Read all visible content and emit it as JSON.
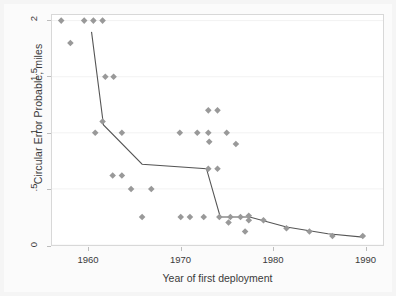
{
  "chart_data": {
    "type": "scatter",
    "title": "",
    "xlabel": "Year of first deployment",
    "ylabel": "Circular Error Probable, miles",
    "xlim": [
      1956,
      1992
    ],
    "ylim": [
      0,
      2.05
    ],
    "xticks": [
      1960,
      1970,
      1980,
      1990
    ],
    "xticklabels": [
      "1960",
      "1970",
      "1980",
      "1990"
    ],
    "yticks": [
      0,
      0.5,
      1,
      1.5,
      2
    ],
    "yticklabels": [
      "0",
      ".5",
      "1",
      "1.5",
      "2"
    ],
    "grid": "horizontal-faint",
    "legend": "none",
    "marker": "diamond",
    "marker_color": "#999999",
    "line_color": "#555555",
    "series": [
      {
        "name": "Missile systems",
        "type": "scatter",
        "points": [
          {
            "x": 1957.0,
            "y": 2.0
          },
          {
            "x": 1958.0,
            "y": 1.8
          },
          {
            "x": 1959.5,
            "y": 2.0
          },
          {
            "x": 1960.5,
            "y": 2.0
          },
          {
            "x": 1961.5,
            "y": 2.0
          },
          {
            "x": 1960.7,
            "y": 1.0
          },
          {
            "x": 1961.8,
            "y": 1.5
          },
          {
            "x": 1962.7,
            "y": 1.5
          },
          {
            "x": 1961.5,
            "y": 1.1
          },
          {
            "x": 1962.6,
            "y": 0.62
          },
          {
            "x": 1963.6,
            "y": 0.62
          },
          {
            "x": 1963.6,
            "y": 1.0
          },
          {
            "x": 1964.6,
            "y": 0.5
          },
          {
            "x": 1966.8,
            "y": 0.5
          },
          {
            "x": 1965.8,
            "y": 0.25
          },
          {
            "x": 1969.9,
            "y": 1.0
          },
          {
            "x": 1971.8,
            "y": 1.0
          },
          {
            "x": 1970.0,
            "y": 0.25
          },
          {
            "x": 1971.0,
            "y": 0.25
          },
          {
            "x": 1973.0,
            "y": 1.2
          },
          {
            "x": 1974.0,
            "y": 1.2
          },
          {
            "x": 1973.0,
            "y": 1.0
          },
          {
            "x": 1973.1,
            "y": 0.92
          },
          {
            "x": 1975.0,
            "y": 1.0
          },
          {
            "x": 1976.0,
            "y": 0.9
          },
          {
            "x": 1973.0,
            "y": 0.68
          },
          {
            "x": 1974.0,
            "y": 0.68
          },
          {
            "x": 1972.5,
            "y": 0.25
          },
          {
            "x": 1974.2,
            "y": 0.25
          },
          {
            "x": 1975.4,
            "y": 0.25
          },
          {
            "x": 1975.2,
            "y": 0.2
          },
          {
            "x": 1976.5,
            "y": 0.25
          },
          {
            "x": 1977.4,
            "y": 0.26
          },
          {
            "x": 1977.4,
            "y": 0.22
          },
          {
            "x": 1977.0,
            "y": 0.12
          },
          {
            "x": 1979.0,
            "y": 0.22
          },
          {
            "x": 1981.5,
            "y": 0.15
          },
          {
            "x": 1984.0,
            "y": 0.12
          },
          {
            "x": 1986.5,
            "y": 0.08
          },
          {
            "x": 1989.8,
            "y": 0.08
          }
        ]
      },
      {
        "name": "Trend (segmented fit)",
        "type": "line",
        "points": [
          {
            "x": 1960.3,
            "y": 1.9
          },
          {
            "x": 1961.6,
            "y": 1.07
          },
          {
            "x": 1965.8,
            "y": 0.72
          },
          {
            "x": 1972.8,
            "y": 0.68
          },
          {
            "x": 1974.3,
            "y": 0.25
          },
          {
            "x": 1977.5,
            "y": 0.25
          },
          {
            "x": 1981.5,
            "y": 0.16
          },
          {
            "x": 1986.0,
            "y": 0.1
          },
          {
            "x": 1989.8,
            "y": 0.07
          }
        ]
      }
    ]
  },
  "axes": {
    "ylabel": "Circular Error Probable, miles",
    "xlabel": "Year of first deployment",
    "ytick_labels": [
      "0",
      ".5",
      "1",
      "1.5",
      "2"
    ],
    "xtick_labels": [
      "1960",
      "1970",
      "1980",
      "1990"
    ]
  }
}
